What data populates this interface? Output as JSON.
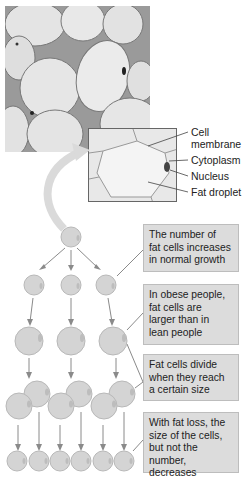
{
  "figure": {
    "photo": {
      "description": "micrograph of adipose tissue"
    },
    "inset_labels": [
      {
        "text": "Cell\nmembrane",
        "line1": "Cell",
        "line2": "membrane"
      },
      {
        "text": "Cytoplasm"
      },
      {
        "text": "Nucleus"
      },
      {
        "text": "Fat droplet"
      }
    ],
    "callouts": [
      {
        "lines": [
          "The number of",
          "fat cells increases",
          "in normal growth"
        ]
      },
      {
        "lines": [
          "In obese people,",
          "fat cells are",
          "larger than in",
          "lean people"
        ]
      },
      {
        "lines": [
          "Fat cells divide",
          "when they reach",
          "a certain size"
        ]
      },
      {
        "lines": [
          "With fat loss, the",
          "size of the cells,",
          "but not the number,",
          "decreases"
        ]
      }
    ],
    "colors": {
      "callout_fill": "#dcdcdc",
      "cell_fill": "#d2d2d2",
      "arrow": "#8a8a8a",
      "photo_bg": "#b4b4b4"
    }
  }
}
